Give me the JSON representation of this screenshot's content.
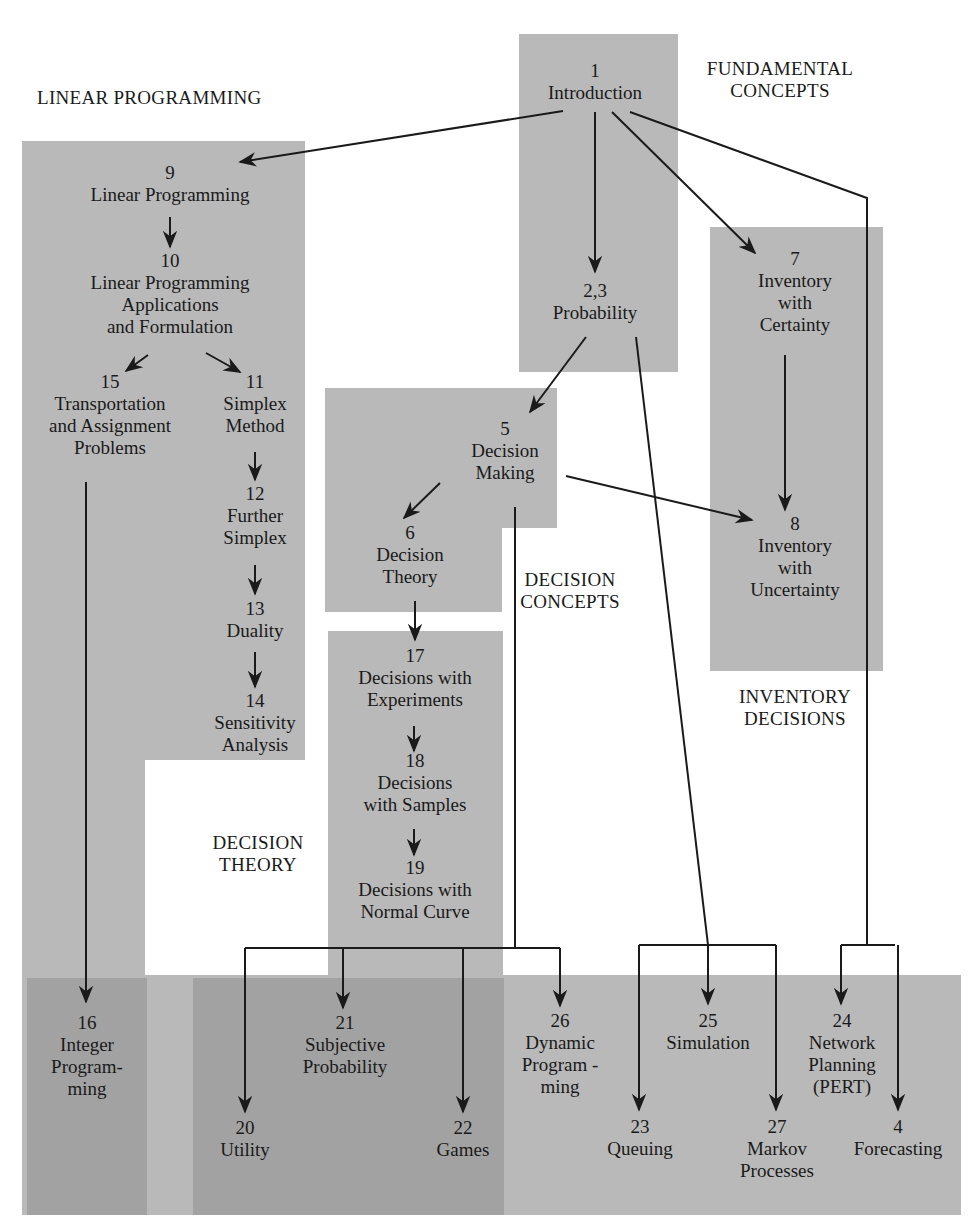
{
  "groups": {
    "fundamental": [
      "FUNDAMENTAL",
      "CONCEPTS"
    ],
    "linear_programming": [
      "LINEAR PROGRAMMING"
    ],
    "decision_concepts": [
      "DECISION",
      "CONCEPTS"
    ],
    "inventory": [
      "INVENTORY",
      "DECISIONS"
    ],
    "decision_theory": [
      "DECISION",
      "THEORY"
    ]
  },
  "nodes": {
    "n1": {
      "num": "1",
      "title": [
        "Introduction"
      ]
    },
    "n23": {
      "num": "2,3",
      "title": [
        "Probability"
      ]
    },
    "n9": {
      "num": "9",
      "title": [
        "Linear Programming"
      ]
    },
    "n10": {
      "num": "10",
      "title": [
        "Linear Programming",
        "Applications",
        "and Formulation"
      ]
    },
    "n15": {
      "num": "15",
      "title": [
        "Transportation",
        "and Assignment",
        "Problems"
      ]
    },
    "n11": {
      "num": "11",
      "title": [
        "Simplex",
        "Method"
      ]
    },
    "n12": {
      "num": "12",
      "title": [
        "Further",
        "Simplex"
      ]
    },
    "n13": {
      "num": "13",
      "title": [
        "Duality"
      ]
    },
    "n14": {
      "num": "14",
      "title": [
        "Sensitivity",
        "Analysis"
      ]
    },
    "n5": {
      "num": "5",
      "title": [
        "Decision",
        "Making"
      ]
    },
    "n6": {
      "num": "6",
      "title": [
        "Decision",
        "Theory"
      ]
    },
    "n7": {
      "num": "7",
      "title": [
        "Inventory",
        "with",
        "Certainty"
      ]
    },
    "n8": {
      "num": "8",
      "title": [
        "Inventory",
        "with",
        "Uncertainty"
      ]
    },
    "n17": {
      "num": "17",
      "title": [
        "Decisions with",
        "Experiments"
      ]
    },
    "n18": {
      "num": "18",
      "title": [
        "Decisions",
        "with Samples"
      ]
    },
    "n19": {
      "num": "19",
      "title": [
        "Decisions with",
        "Normal Curve"
      ]
    },
    "n16": {
      "num": "16",
      "title": [
        "Integer",
        "Program-",
        "ming"
      ]
    },
    "n21": {
      "num": "21",
      "title": [
        "Subjective",
        "Probability"
      ]
    },
    "n20": {
      "num": "20",
      "title": [
        "Utility"
      ]
    },
    "n22": {
      "num": "22",
      "title": [
        "Games"
      ]
    },
    "n26": {
      "num": "26",
      "title": [
        "Dynamic",
        "Program -",
        "ming"
      ]
    },
    "n25": {
      "num": "25",
      "title": [
        "Simulation"
      ]
    },
    "n23q": {
      "num": "23",
      "title": [
        "Queuing"
      ]
    },
    "n27": {
      "num": "27",
      "title": [
        "Markov",
        "Processes"
      ]
    },
    "n24": {
      "num": "24",
      "title": [
        "Network",
        "Planning",
        "(PERT)"
      ]
    },
    "n4": {
      "num": "4",
      "title": [
        "Forecasting"
      ]
    }
  },
  "colors": {
    "light_gray": "#b9b9b9",
    "dark_gray": "#a2a2a2",
    "line": "#1a1a1a"
  }
}
